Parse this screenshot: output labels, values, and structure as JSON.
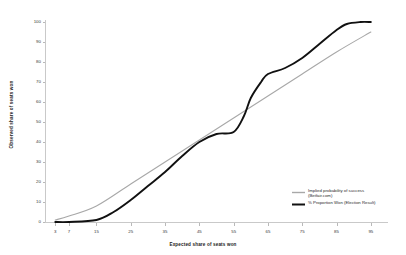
{
  "chart_data": {
    "type": "line",
    "title": "",
    "xlabel": "Expected share of seats won",
    "ylabel": "Observed share of seats won",
    "xlim": [
      0,
      100
    ],
    "ylim": [
      0,
      100
    ],
    "grid": false,
    "legend_position": "bottom-right",
    "background": "#ffffff",
    "xticks": [
      "3",
      "7",
      "15",
      "25",
      "35",
      "45",
      "55",
      "65",
      "75",
      "85",
      "95"
    ],
    "xtick_values": [
      3,
      7,
      15,
      25,
      35,
      45,
      55,
      65,
      75,
      85,
      95
    ],
    "yticks": [
      "0",
      "10",
      "20",
      "30",
      "40",
      "50",
      "60",
      "70",
      "80",
      "90",
      "100"
    ],
    "ytick_values": [
      0,
      10,
      20,
      30,
      40,
      50,
      60,
      70,
      80,
      90,
      100
    ],
    "series": [
      {
        "name": "Implied probability of success (Betfair.com)",
        "legend_line1": "Implied probability of success",
        "legend_line2": "(Betfair.com)",
        "color": "#a8a8a8",
        "width": 1.1,
        "x": [
          3,
          7,
          15,
          25,
          35,
          45,
          55,
          65,
          75,
          85,
          95
        ],
        "values": [
          1,
          3,
          8,
          19,
          30,
          41,
          52,
          63,
          74,
          85,
          95
        ]
      },
      {
        "name": "% Proportion Won (Election Result)",
        "legend_line1": "% Proportion Won (Election Result)",
        "legend_line2": "",
        "color": "#111111",
        "width": 1.9,
        "x": [
          3,
          7,
          15,
          20,
          25,
          30,
          35,
          40,
          45,
          50,
          55,
          58,
          60,
          63,
          65,
          70,
          75,
          80,
          85,
          88,
          92,
          95
        ],
        "values": [
          0,
          0,
          1,
          5,
          11,
          18,
          25,
          33,
          40,
          44,
          45,
          53,
          62,
          70,
          74,
          77,
          82,
          89,
          96,
          99,
          100,
          100
        ]
      }
    ]
  }
}
